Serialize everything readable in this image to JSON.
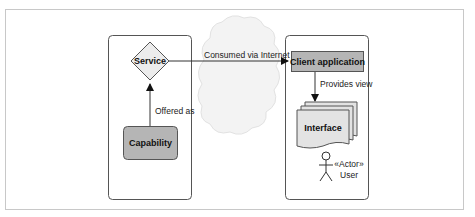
{
  "diagram": {
    "nodes": {
      "service": {
        "label": "Service",
        "shape": "diamond"
      },
      "capability": {
        "label": "Capability",
        "shape": "rounded-rect"
      },
      "client_application": {
        "label": "Client application",
        "shape": "rect"
      },
      "interface": {
        "label": "Interface",
        "shape": "document-stack"
      },
      "user": {
        "stereotype": "«Actor»",
        "label": "User",
        "shape": "stick-figure"
      },
      "internet": {
        "shape": "cloud"
      }
    },
    "edges": {
      "offered_as": {
        "from": "capability",
        "to": "service",
        "label": "Offered as"
      },
      "consumed_via_internet": {
        "from": "service",
        "to": "client_application",
        "label": "Consumed via Internet"
      },
      "provides_view": {
        "from": "client_application",
        "to": "interface",
        "label": "Provides view"
      }
    },
    "colors": {
      "box_fill": "#b5b5b5",
      "diamond_fill": "#ececec",
      "document_fill": "#e3e3e3",
      "cloud_fill": "#f3f3f3",
      "border": "#555555",
      "frame": "#c8c8c8"
    }
  }
}
